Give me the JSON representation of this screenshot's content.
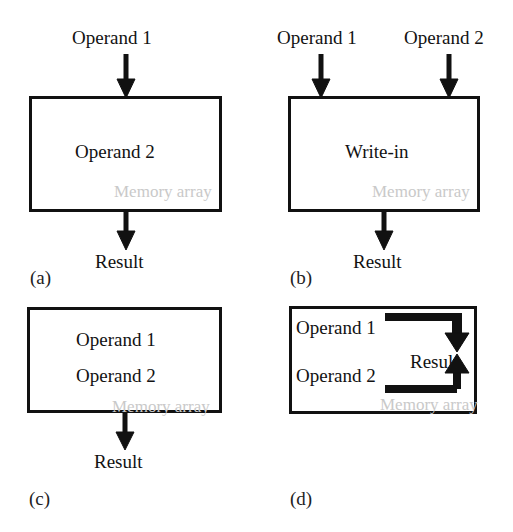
{
  "figure": {
    "background_color": "#ffffff",
    "line_color": "#111111",
    "text_color": "#121212",
    "memory_label_color": "#c9c9c9",
    "panels": [
      {
        "key": "a",
        "caption": "(a)",
        "inputs_above": [
          "Operand 1"
        ],
        "box_texts": [
          "Operand 2"
        ],
        "memory_label": "Memory array",
        "output_below": "Result",
        "internal_arrows": []
      },
      {
        "key": "b",
        "caption": "(b)",
        "inputs_above": [
          "Operand 1",
          "Operand 2"
        ],
        "box_texts": [
          "Write-in"
        ],
        "memory_label": "Memory array",
        "output_below": "Result",
        "internal_arrows": []
      },
      {
        "key": "c",
        "caption": "(c)",
        "inputs_above": [],
        "box_texts": [
          "Operand 1",
          "Operand 2"
        ],
        "memory_label": "Memory array",
        "output_below": "Result",
        "internal_arrows": []
      },
      {
        "key": "d",
        "caption": "(d)",
        "inputs_above": [],
        "box_texts": [
          "Operand 1",
          "Operand 2"
        ],
        "memory_label": "Memory array",
        "output_below": "",
        "internal_result_label": "Result",
        "internal_arrows": [
          "down-elbow",
          "up-elbow"
        ]
      }
    ]
  }
}
